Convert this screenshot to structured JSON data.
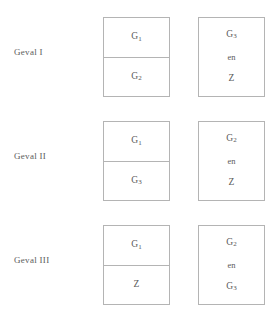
{
  "diagram": {
    "colors": {
      "border": "#b4b4b4",
      "text": "#5a5a5a",
      "background": "#ffffff"
    },
    "conjunction": "en",
    "rows": [
      {
        "label": "Geval  I",
        "left_box": {
          "upper": {
            "base": "G",
            "sub": "1"
          },
          "lower": {
            "base": "G",
            "sub": "2"
          }
        },
        "right_box": {
          "first": {
            "base": "G",
            "sub": "3"
          },
          "conjunction": "en",
          "second": {
            "base": "Z",
            "sub": ""
          }
        }
      },
      {
        "label": "Geval  II",
        "left_box": {
          "upper": {
            "base": "G",
            "sub": "1"
          },
          "lower": {
            "base": "G",
            "sub": "3"
          }
        },
        "right_box": {
          "first": {
            "base": "G",
            "sub": "2"
          },
          "conjunction": "en",
          "second": {
            "base": "Z",
            "sub": ""
          }
        }
      },
      {
        "label": "Geval  III",
        "left_box": {
          "upper": {
            "base": "G",
            "sub": "1"
          },
          "lower": {
            "base": "Z",
            "sub": ""
          }
        },
        "right_box": {
          "first": {
            "base": "G",
            "sub": "2"
          },
          "conjunction": "en",
          "second": {
            "base": "G",
            "sub": "3"
          }
        }
      }
    ]
  }
}
